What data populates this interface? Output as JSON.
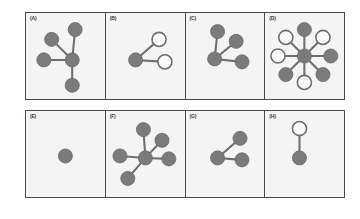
{
  "figure": {
    "rows": [
      {
        "name": "top-row",
        "panels": [
          {
            "label": "(A)",
            "nodes": [
              {
                "id": "center",
                "x": 47,
                "y": 48,
                "state": "filled"
              },
              {
                "id": "top",
                "x": 50,
                "y": 17,
                "state": "filled"
              },
              {
                "id": "upper-left",
                "x": 26,
                "y": 27,
                "state": "filled"
              },
              {
                "id": "left",
                "x": 18,
                "y": 48,
                "state": "filled"
              },
              {
                "id": "bottom",
                "x": 47,
                "y": 74,
                "state": "filled"
              }
            ],
            "edges": [
              [
                "center",
                "top"
              ],
              [
                "center",
                "upper-left"
              ],
              [
                "center",
                "left"
              ],
              [
                "center",
                "bottom"
              ]
            ]
          },
          {
            "label": "(B)",
            "nodes": [
              {
                "id": "center",
                "x": 30,
                "y": 48,
                "state": "filled"
              },
              {
                "id": "upper-right",
                "x": 54,
                "y": 27,
                "state": "open"
              },
              {
                "id": "right",
                "x": 60,
                "y": 50,
                "state": "open"
              }
            ],
            "edges": [
              [
                "center",
                "upper-right"
              ],
              [
                "center",
                "right"
              ]
            ]
          },
          {
            "label": "(C)",
            "nodes": [
              {
                "id": "center",
                "x": 29,
                "y": 47,
                "state": "filled"
              },
              {
                "id": "top",
                "x": 32,
                "y": 19,
                "state": "filled"
              },
              {
                "id": "upper-right",
                "x": 51,
                "y": 29,
                "state": "filled"
              },
              {
                "id": "right",
                "x": 57,
                "y": 50,
                "state": "filled"
              }
            ],
            "edges": [
              [
                "center",
                "top"
              ],
              [
                "center",
                "upper-right"
              ],
              [
                "center",
                "right"
              ]
            ]
          },
          {
            "label": "(D)",
            "nodes": [
              {
                "id": "center",
                "x": 40,
                "y": 44,
                "state": "filled"
              },
              {
                "id": "n",
                "x": 40,
                "y": 17,
                "state": "filled"
              },
              {
                "id": "ne",
                "x": 59,
                "y": 25,
                "state": "open"
              },
              {
                "id": "e",
                "x": 67,
                "y": 44,
                "state": "filled"
              },
              {
                "id": "se",
                "x": 59,
                "y": 63,
                "state": "filled"
              },
              {
                "id": "s",
                "x": 40,
                "y": 71,
                "state": "open"
              },
              {
                "id": "sw",
                "x": 21,
                "y": 63,
                "state": "filled"
              },
              {
                "id": "w",
                "x": 13,
                "y": 44,
                "state": "open"
              },
              {
                "id": "nw",
                "x": 21,
                "y": 25,
                "state": "open"
              }
            ],
            "edges": [
              [
                "center",
                "n"
              ],
              [
                "center",
                "ne"
              ],
              [
                "center",
                "e"
              ],
              [
                "center",
                "se"
              ],
              [
                "center",
                "s"
              ],
              [
                "center",
                "sw"
              ],
              [
                "center",
                "w"
              ],
              [
                "center",
                "nw"
              ]
            ]
          }
        ]
      },
      {
        "name": "bottom-row",
        "panels": [
          {
            "label": "(E)",
            "nodes": [
              {
                "id": "single",
                "x": 40,
                "y": 46,
                "state": "filled"
              }
            ],
            "edges": []
          },
          {
            "label": "(F)",
            "nodes": [
              {
                "id": "center",
                "x": 40,
                "y": 48,
                "state": "filled"
              },
              {
                "id": "top",
                "x": 38,
                "y": 19,
                "state": "filled"
              },
              {
                "id": "upper-right",
                "x": 57,
                "y": 30,
                "state": "filled"
              },
              {
                "id": "left",
                "x": 14,
                "y": 46,
                "state": "filled"
              },
              {
                "id": "right",
                "x": 64,
                "y": 49,
                "state": "filled"
              },
              {
                "id": "lower-left",
                "x": 22,
                "y": 69,
                "state": "filled"
              }
            ],
            "edges": [
              [
                "center",
                "top"
              ],
              [
                "center",
                "upper-right"
              ],
              [
                "center",
                "left"
              ],
              [
                "center",
                "right"
              ],
              [
                "center",
                "lower-left"
              ]
            ]
          },
          {
            "label": "(G)",
            "nodes": [
              {
                "id": "left",
                "x": 32,
                "y": 48,
                "state": "filled"
              },
              {
                "id": "upper-right",
                "x": 55,
                "y": 28,
                "state": "filled"
              },
              {
                "id": "right",
                "x": 57,
                "y": 50,
                "state": "filled"
              }
            ],
            "edges": [
              [
                "left",
                "upper-right"
              ],
              [
                "left",
                "right"
              ]
            ]
          },
          {
            "label": "(H)",
            "nodes": [
              {
                "id": "top",
                "x": 35,
                "y": 18,
                "state": "open"
              },
              {
                "id": "bottom",
                "x": 35,
                "y": 48,
                "state": "filled"
              }
            ],
            "edges": [
              [
                "top",
                "bottom"
              ]
            ]
          }
        ]
      }
    ]
  },
  "style": {
    "node_fill_color": "#7b7b7b",
    "node_open_color": "#fafafa",
    "edge_color": "#6f6f6f",
    "panel_background": "#f4f4f4",
    "frame_color": "#4a4a4a",
    "page_background": "#ffffff",
    "node_radius": 7.2
  }
}
